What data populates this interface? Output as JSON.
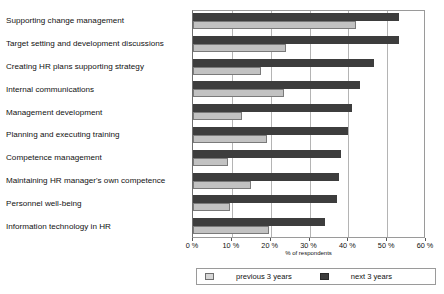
{
  "chart_data": {
    "type": "bar",
    "orientation": "horizontal",
    "title": "",
    "xlabel": "% of respondents",
    "ylabel": "",
    "xlim": [
      0,
      60
    ],
    "xticks": [
      "0 %",
      "10 %",
      "20 %",
      "30 %",
      "40 %",
      "50 %",
      "60 %"
    ],
    "xtick_values": [
      0,
      10,
      20,
      30,
      40,
      50,
      60
    ],
    "grid": true,
    "legend_position": "bottom",
    "categories": [
      "Supporting change management",
      "Target setting and development discussions",
      "Creating HR plans supporting strategy",
      "Internal communications",
      "Management development",
      "Planning and executing training",
      "Competence management",
      "Maintaining HR manager's own competence",
      "Personnel well-being",
      "Information technology in HR"
    ],
    "series": [
      {
        "name": "previous 3 years",
        "color": "#c2c2c2",
        "values": [
          42,
          24,
          17.5,
          23.5,
          12.5,
          19,
          9,
          15,
          9.5,
          19.5
        ]
      },
      {
        "name": "next 3 years",
        "color": "#3d3d3d",
        "values": [
          53,
          53,
          46.5,
          43,
          41,
          40,
          38,
          37.5,
          37,
          34
        ]
      }
    ]
  },
  "legend": {
    "entries": [
      {
        "label": "previous 3 years",
        "swatch": "prev"
      },
      {
        "label": "next 3 years",
        "swatch": "next"
      }
    ]
  }
}
